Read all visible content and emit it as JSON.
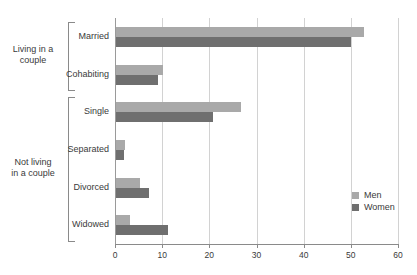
{
  "chart_data": {
    "type": "bar",
    "orientation": "horizontal",
    "title": "",
    "xlabel": "",
    "ylabel": "",
    "xlim": [
      0,
      60
    ],
    "xticks": [
      0,
      10,
      20,
      30,
      40,
      50,
      60
    ],
    "xtick_labels": [
      "0",
      "10",
      "20",
      "30",
      "40",
      "50",
      "60"
    ],
    "grid": true,
    "grid_axis": "x",
    "legend_position": "right-inside",
    "categories": [
      "Married",
      "Cohabiting",
      "Single",
      "Separated",
      "Divorced",
      "Widowed"
    ],
    "series": [
      {
        "name": "Men",
        "color": "#a9a9a9",
        "values": [
          52.5,
          10.0,
          26.5,
          2.0,
          5.0,
          3.0
        ]
      },
      {
        "name": "Women",
        "color": "#6f6f6f",
        "values": [
          49.8,
          9.0,
          20.6,
          1.8,
          7.0,
          11.0
        ]
      }
    ],
    "groups": [
      {
        "label": "Living in a\ncouple",
        "categories": [
          "Married",
          "Cohabiting"
        ]
      },
      {
        "label": "Not living\nin a couple",
        "categories": [
          "Single",
          "Separated",
          "Divorced",
          "Widowed"
        ]
      }
    ]
  },
  "legend": {
    "items": [
      {
        "label": "Men",
        "swatch": "men"
      },
      {
        "label": "Women",
        "swatch": "women"
      }
    ]
  },
  "axis": {
    "ticks": [
      "0",
      "10",
      "20",
      "30",
      "40",
      "50",
      "60"
    ]
  },
  "categories": {
    "labels": [
      "Married",
      "Cohabiting",
      "Single",
      "Separated",
      "Divorced",
      "Widowed"
    ]
  },
  "groups": {
    "labels": [
      "Living in a\ncouple",
      "Not living\nin a couple"
    ]
  },
  "colors": {
    "men": "#a9a9a9",
    "women": "#6f6f6f",
    "grid": "#d2d2d2",
    "axis": "#8a8a8a",
    "text": "#3a3a3a",
    "background": "#ffffff"
  }
}
